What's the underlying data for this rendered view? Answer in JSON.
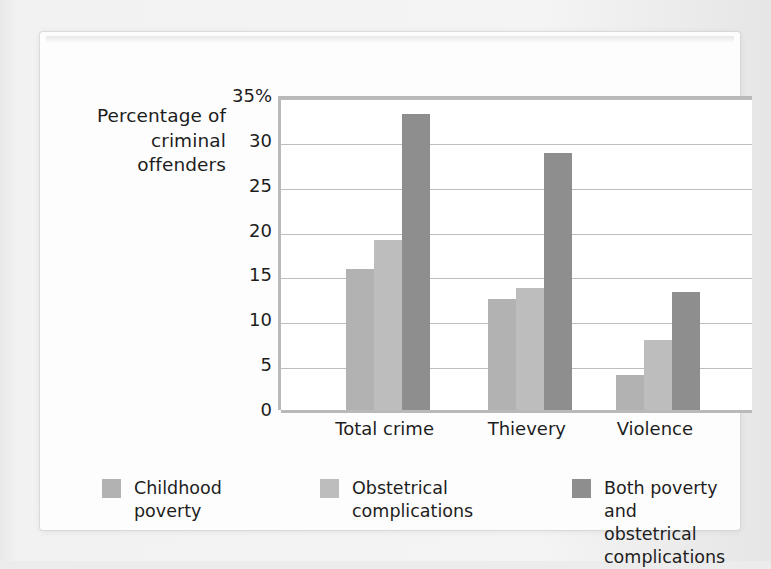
{
  "chart_data": {
    "type": "bar",
    "title": "",
    "xlabel": "",
    "ylabel": "Percentage\nof criminal\noffenders",
    "ylim": [
      0,
      35
    ],
    "ytick_labels": [
      "0",
      "5",
      "10",
      "15",
      "20",
      "25",
      "30",
      "35%"
    ],
    "ytick_values": [
      0,
      5,
      10,
      15,
      20,
      25,
      30,
      35
    ],
    "grid": true,
    "legend_position": "bottom",
    "categories": [
      "Total crime",
      "Thievery",
      "Violence"
    ],
    "series": [
      {
        "name": "Childhood\npoverty",
        "color": "#b2b2b2",
        "values": [
          15.7,
          12.4,
          3.9
        ]
      },
      {
        "name": "Obstetrical\ncomplications",
        "color": "#bdbdbd",
        "values": [
          19.0,
          13.6,
          7.8
        ]
      },
      {
        "name": "Both poverty and\nobstetrical complications",
        "color": "#8e8e8e",
        "values": [
          33.0,
          28.6,
          13.2
        ]
      }
    ]
  },
  "axis": {
    "y_title": "Percentage\nof criminal\noffenders"
  },
  "legend": {
    "items": [
      {
        "label": "Childhood\npoverty"
      },
      {
        "label": "Obstetrical\ncomplications"
      },
      {
        "label": "Both poverty and\nobstetrical complications"
      }
    ]
  },
  "colors": {
    "series_0": "#b2b2b2",
    "series_1": "#bdbdbd",
    "series_2": "#8e8e8e",
    "gridline": "#bdbdbd",
    "axis": "#b9b9b9",
    "text": "#1d1d1d",
    "card": "#fdfdfd",
    "page": "#ececed"
  }
}
